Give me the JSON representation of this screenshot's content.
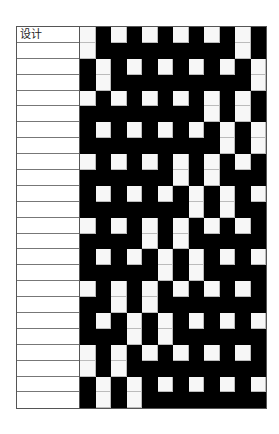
{
  "draft": {
    "label_header": "设计",
    "rows": 24,
    "cols": 12,
    "colors": {
      "filled": "#000000",
      "empty": "#f7f7f7",
      "grid_line": "#bbbbbb"
    },
    "labels": [
      "设计",
      "",
      "",
      "",
      "",
      "",
      "",
      "",
      "",
      "",
      "",
      "",
      "",
      "",
      "",
      "",
      "",
      "",
      "",
      "",
      "",
      "",
      "",
      ""
    ],
    "pattern": [
      "010101010101",
      "011111111101",
      "101010101010",
      "101111111110",
      "010101010101",
      "111111110101",
      "101010101010",
      "111111111010",
      "010101010101",
      "111111010111",
      "101010101010",
      "111111101011",
      "010101010101",
      "111101011111",
      "101010101010",
      "111110101111",
      "010101010101",
      "110101111111",
      "101010101010",
      "111010111111",
      "010101010101",
      "010111111111",
      "101010101010",
      "101011111111"
    ]
  }
}
